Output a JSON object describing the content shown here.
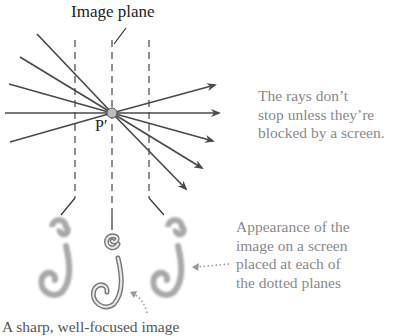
{
  "diagram": {
    "title": "Image plane",
    "point_label": "P′",
    "rays_note": [
      "The rays don’t",
      "stop unless they’re",
      "blocked by a screen."
    ],
    "appearance_note": [
      "Appearance of the",
      "image on a screen",
      "placed at each of",
      "the dotted planes"
    ],
    "bottom_caption": "A sharp, well-focused image",
    "colors": {
      "ray": "#4a4a4a",
      "dashed_line": "#333333",
      "point_fill": "#bdbdbd",
      "note_text": "#8a8a8a",
      "blurred_image": "#a8a8a8"
    },
    "planes": [
      {
        "name": "before-focus",
        "x": 75,
        "appearance": "blurred"
      },
      {
        "name": "image-plane",
        "x": 112,
        "appearance": "sharp"
      },
      {
        "name": "after-focus",
        "x": 149,
        "appearance": "blurred"
      }
    ]
  }
}
